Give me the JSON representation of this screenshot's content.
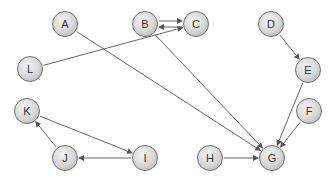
{
  "diagram": {
    "type": "directed-graph",
    "colors": {
      "node_fill": "#d6d6d6",
      "node_border": "#6f6f6f",
      "edge": "#555555",
      "label": "#333333"
    },
    "nodes": [
      {
        "id": "A",
        "label": "A",
        "x": 65,
        "y": 24
      },
      {
        "id": "B",
        "label": "B",
        "x": 145,
        "y": 24
      },
      {
        "id": "C",
        "label": "C",
        "x": 196,
        "y": 24
      },
      {
        "id": "D",
        "label": "D",
        "x": 271,
        "y": 24
      },
      {
        "id": "E",
        "label": "E",
        "x": 308,
        "y": 70
      },
      {
        "id": "L",
        "label": "L",
        "x": 30,
        "y": 69
      },
      {
        "id": "K",
        "label": "K",
        "x": 27,
        "y": 111
      },
      {
        "id": "F",
        "label": "F",
        "x": 309,
        "y": 111
      },
      {
        "id": "J",
        "label": "J",
        "x": 65,
        "y": 158
      },
      {
        "id": "I",
        "label": "I",
        "x": 145,
        "y": 158
      },
      {
        "id": "H",
        "label": "H",
        "x": 210,
        "y": 158
      },
      {
        "id": "G",
        "label": "G",
        "x": 272,
        "y": 158
      }
    ],
    "edges": [
      {
        "from": "B",
        "to": "C",
        "offset": -3
      },
      {
        "from": "C",
        "to": "B",
        "offset": -3
      },
      {
        "from": "L",
        "to": "C",
        "offset": 0
      },
      {
        "from": "A",
        "to": "G",
        "offset": 0
      },
      {
        "from": "B",
        "to": "G",
        "offset": 0
      },
      {
        "from": "D",
        "to": "E",
        "offset": 0
      },
      {
        "from": "E",
        "to": "G",
        "offset": 0
      },
      {
        "from": "F",
        "to": "G",
        "offset": 0
      },
      {
        "from": "H",
        "to": "G",
        "offset": 0
      },
      {
        "from": "K",
        "to": "I",
        "offset": 0
      },
      {
        "from": "I",
        "to": "J",
        "offset": 0
      },
      {
        "from": "J",
        "to": "K",
        "offset": 0
      }
    ]
  }
}
